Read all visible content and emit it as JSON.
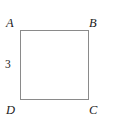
{
  "figure": {
    "type": "square",
    "name": "square-abcd",
    "background_color": "#ffffff",
    "stroke_color": "#8a8a8a",
    "stroke_width": 1,
    "label_color": "#1b1b1b",
    "vertices": [
      {
        "id": "A",
        "label": "A",
        "position": "top-left"
      },
      {
        "id": "B",
        "label": "B",
        "position": "top-right"
      },
      {
        "id": "C",
        "label": "C",
        "position": "bottom-right"
      },
      {
        "id": "D",
        "label": "D",
        "position": "bottom-left"
      }
    ],
    "side_labels": [
      {
        "id": "AD",
        "label": "3",
        "side": "left",
        "edge": "A-D"
      }
    ],
    "geometry": {
      "left": 20,
      "top": 30,
      "width": 69,
      "height": 70
    }
  }
}
